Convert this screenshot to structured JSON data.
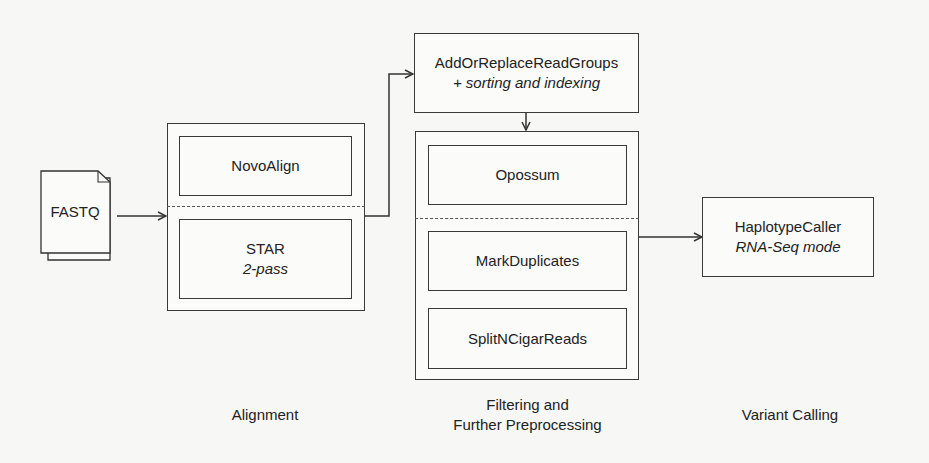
{
  "input": {
    "label": "FASTQ"
  },
  "stages": [
    {
      "caption": [
        "Alignment"
      ],
      "options": [
        {
          "title": "NovoAlign"
        },
        {
          "title": "STAR",
          "subtitle": "2-pass"
        }
      ]
    },
    {
      "pre_step": {
        "title": "AddOrReplaceReadGroups",
        "subtitle": "+ sorting and indexing"
      },
      "caption": [
        "Filtering and",
        "Further Preprocessing"
      ],
      "options": [
        {
          "title": "Opossum"
        },
        {
          "title": "MarkDuplicates",
          "next": "SplitNCigarReads"
        }
      ]
    },
    {
      "caption": [
        "Variant Calling"
      ],
      "options": [
        {
          "title": "HaplotypeCaller",
          "subtitle": "RNA-Seq mode"
        }
      ]
    }
  ]
}
